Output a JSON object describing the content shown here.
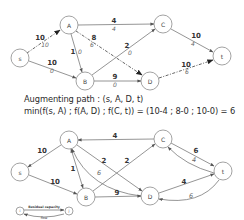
{
  "graph_before": {
    "nodes": [
      {
        "id": "s",
        "label": "s",
        "x": 20,
        "y": 58
      },
      {
        "id": "A",
        "label": "A",
        "x": 69,
        "y": 25
      },
      {
        "id": "B",
        "label": "B",
        "x": 85,
        "y": 81
      },
      {
        "id": "C",
        "label": "C",
        "x": 163,
        "y": 24
      },
      {
        "id": "D",
        "label": "D",
        "x": 150,
        "y": 81
      },
      {
        "id": "t",
        "label": "t",
        "x": 222,
        "y": 56
      }
    ],
    "edges": [
      {
        "from": "s",
        "to": "A",
        "capacity": "10",
        "flow": "10",
        "augmenting": true
      },
      {
        "from": "s",
        "to": "B",
        "capacity": "10",
        "flow": "0",
        "augmenting": false
      },
      {
        "from": "A",
        "to": "C",
        "capacity": "4",
        "flow": "4",
        "augmenting": false
      },
      {
        "from": "A",
        "to": "B",
        "capacity": "1",
        "flow": "0",
        "augmenting": false
      },
      {
        "from": "A",
        "to": "D",
        "capacity": "8",
        "flow": "6",
        "augmenting": true
      },
      {
        "from": "B",
        "to": "C",
        "capacity": "2",
        "flow": "0",
        "augmenting": false
      },
      {
        "from": "B",
        "to": "D",
        "capacity": "9",
        "flow": "0",
        "augmenting": false
      },
      {
        "from": "C",
        "to": "t",
        "capacity": "10",
        "flow": "4",
        "augmenting": false
      },
      {
        "from": "D",
        "to": "t",
        "capacity": "10",
        "flow": "6",
        "augmenting": true
      }
    ]
  },
  "caption": {
    "line1": "Augmenting path : (s, A, D, t)",
    "line2": "min(f(s, A) ; f(A, D) ; f(C, t)) = (10-4 ; 8-0 ; 10-0) = 6"
  },
  "graph_after": {
    "nodes": [
      {
        "id": "s",
        "label": "s",
        "x": 20,
        "y": 172
      },
      {
        "id": "A",
        "label": "A",
        "x": 69,
        "y": 140
      },
      {
        "id": "B",
        "label": "B",
        "x": 86,
        "y": 197
      },
      {
        "id": "C",
        "label": "C",
        "x": 163,
        "y": 139
      },
      {
        "id": "D",
        "label": "D",
        "x": 150,
        "y": 196
      },
      {
        "id": "t",
        "label": "t",
        "x": 223,
        "y": 171
      }
    ],
    "residual_edges": [
      {
        "from": "A",
        "to": "s",
        "residual": "10"
      },
      {
        "from": "s",
        "to": "B",
        "residual": "10"
      },
      {
        "from": "C",
        "to": "A",
        "residual": "4"
      },
      {
        "from": "A",
        "to": "B",
        "residual": "1"
      },
      {
        "from": "A",
        "to": "D",
        "residual": "2"
      },
      {
        "from": "D",
        "to": "A",
        "flow": "6"
      },
      {
        "from": "B",
        "to": "C",
        "residual": "2"
      },
      {
        "from": "B",
        "to": "D",
        "residual": "9"
      },
      {
        "from": "C",
        "to": "t",
        "residual": "6"
      },
      {
        "from": "t",
        "to": "C",
        "flow": "4"
      },
      {
        "from": "D",
        "to": "t",
        "residual": "4"
      },
      {
        "from": "t",
        "to": "D",
        "flow": "6"
      }
    ]
  },
  "legend": {
    "node_i": "i",
    "node_j": "j",
    "top_label": "Residual capacity",
    "bottom_label": "flow"
  }
}
